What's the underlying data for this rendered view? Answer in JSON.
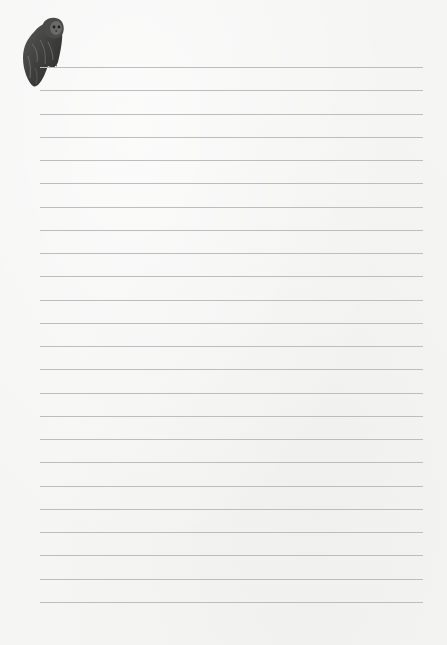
{
  "page": {
    "type": "ruled-notepaper",
    "background_color": "#f5f5f4",
    "rule_color": "#bdbdbb",
    "rule_count": 24,
    "first_rule_y": 67,
    "rule_spacing": 23.26,
    "rule_left_x": 40,
    "rule_right_x": 423
  },
  "decoration": {
    "icon": "owl-icon",
    "description": "Perched owl illustration at top-left, sitting on the first ruled line"
  }
}
